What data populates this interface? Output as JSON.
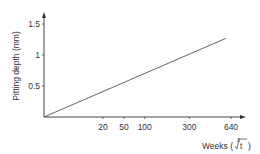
{
  "chart_data": {
    "type": "line",
    "title": "",
    "xlabel": "Weeks (∛t)",
    "ylabel": "Pitting depth (mm)",
    "x_scale": "cube-root",
    "x_ticks": [
      20,
      50,
      100,
      300,
      640
    ],
    "y_ticks": [
      0.5,
      1,
      1.5
    ],
    "ylim": [
      0,
      1.6
    ],
    "xlim": [
      0,
      700
    ],
    "grid": false,
    "legend": null,
    "series": [
      {
        "name": "Pitting depth",
        "x": [
          0,
          590
        ],
        "y": [
          0,
          1.27
        ]
      }
    ]
  },
  "labels": {
    "ylabel": "Pitting depth (mm)",
    "xlabel_prefix": "Weeks (",
    "xlabel_root_index": "3",
    "xlabel_var": "t",
    "xlabel_suffix": ")",
    "x_tick_labels": [
      "20",
      "50",
      "100",
      "300",
      "640"
    ],
    "y_tick_labels": [
      "0.5",
      "1",
      "1.5"
    ]
  },
  "colors": {
    "axis": "#333333",
    "line": "#555555",
    "text": "#333333"
  }
}
